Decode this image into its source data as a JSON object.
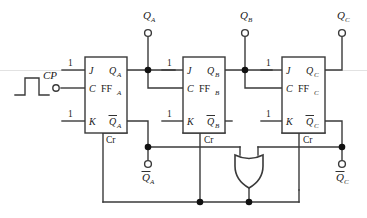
{
  "diagram": {
    "clock": {
      "label": "CP",
      "waveform_name": "pulse-waveform"
    },
    "constants": {
      "logic_one": "1"
    },
    "flipflops": [
      {
        "id": "ffa",
        "name": "FF",
        "subscript": "A",
        "j_label": "J",
        "c_label": "C",
        "k_label": "K",
        "q_label": "Q",
        "q_sub": "A",
        "qbar_label": "Q",
        "qbar_sub": "A",
        "clear_label": "Cr"
      },
      {
        "id": "ffb",
        "name": "FF",
        "subscript": "B",
        "j_label": "J",
        "c_label": "C",
        "k_label": "K",
        "q_label": "Q",
        "q_sub": "B",
        "qbar_label": "Q",
        "qbar_sub": "B",
        "clear_label": "Cr"
      },
      {
        "id": "ffc",
        "name": "FF",
        "subscript": "C",
        "j_label": "J",
        "c_label": "C",
        "k_label": "K",
        "q_label": "Q",
        "q_sub": "C",
        "qbar_label": "Q",
        "qbar_sub": "C",
        "clear_label": "Cr"
      }
    ],
    "outputs_top": [
      {
        "label": "Q",
        "sub": "A",
        "overbar": false
      },
      {
        "label": "Q",
        "sub": "B",
        "overbar": false
      },
      {
        "label": "Q",
        "sub": "C",
        "overbar": false
      }
    ],
    "outputs_bottom": [
      {
        "label": "Q",
        "sub": "A",
        "overbar": true
      },
      {
        "label": "Q",
        "sub": "C",
        "overbar": true
      }
    ],
    "gate": {
      "type": "OR",
      "name": "or-gate"
    },
    "colors": {
      "wire": "#3a3a3a",
      "text": "#1a1a1a",
      "background": "#ffffff",
      "junction": "#111111"
    }
  }
}
